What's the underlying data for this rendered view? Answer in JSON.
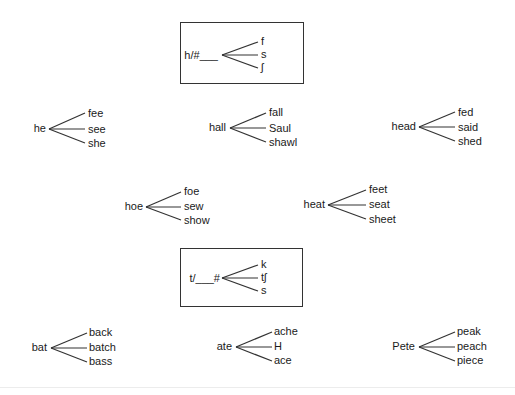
{
  "rules": [
    {
      "id": "rule-h-initial",
      "context": "h/#___",
      "branches": [
        "f",
        "s",
        "ʃ"
      ],
      "box": {
        "x": 180,
        "y": 22,
        "w": 124,
        "h": 62
      },
      "root_right": 218,
      "root_y": 49,
      "apex": {
        "x": 222,
        "y": 55
      },
      "ends_x": 258,
      "ends_y": [
        42,
        55,
        68
      ],
      "branch_x": 261
    },
    {
      "id": "rule-t-final",
      "context": "t/___#",
      "branches": [
        "k",
        "tʃ",
        "s"
      ],
      "box": {
        "x": 180,
        "y": 248,
        "w": 123,
        "h": 59
      },
      "root_right": 220,
      "root_y": 272,
      "apex": {
        "x": 222,
        "y": 278
      },
      "ends_x": 258,
      "ends_y": [
        265,
        278,
        291
      ],
      "branch_x": 261
    }
  ],
  "groups": [
    {
      "id": "he",
      "root": "he",
      "words": [
        "fee",
        "see",
        "she"
      ],
      "root_right": 46,
      "apex": {
        "x": 49,
        "y": 129
      },
      "ends_x": 85,
      "ends_y": [
        113,
        129,
        143
      ],
      "word_x": 88,
      "word_y": [
        107,
        123,
        137
      ]
    },
    {
      "id": "hall",
      "root": "hall",
      "words": [
        "fall",
        "Saul",
        "shawl"
      ],
      "root_right": 226,
      "apex": {
        "x": 230,
        "y": 128
      },
      "ends_x": 266,
      "ends_y": [
        113,
        128,
        142
      ],
      "word_x": 269,
      "word_y": [
        106,
        122,
        136
      ]
    },
    {
      "id": "head",
      "root": "head",
      "words": [
        "fed",
        "said",
        "shed"
      ],
      "root_right": 416,
      "apex": {
        "x": 419,
        "y": 127
      },
      "ends_x": 455,
      "ends_y": [
        112,
        127,
        141
      ],
      "word_x": 458,
      "word_y": [
        106,
        121,
        135
      ]
    },
    {
      "id": "hoe",
      "root": "hoe",
      "words": [
        "foe",
        "sew",
        "show"
      ],
      "root_right": 143,
      "apex": {
        "x": 146,
        "y": 207
      },
      "ends_x": 181,
      "ends_y": [
        192,
        207,
        220
      ],
      "word_x": 184,
      "word_y": [
        185,
        200,
        214
      ]
    },
    {
      "id": "heat",
      "root": "heat",
      "words": [
        "feet",
        "seat",
        "sheet"
      ],
      "root_right": 325,
      "apex": {
        "x": 328,
        "y": 205
      },
      "ends_x": 366,
      "ends_y": [
        190,
        205,
        219
      ],
      "word_x": 369,
      "word_y": [
        183,
        198,
        213
      ]
    },
    {
      "id": "bat",
      "root": "bat",
      "words": [
        "back",
        "batch",
        "bass"
      ],
      "root_right": 47,
      "apex": {
        "x": 51,
        "y": 348
      },
      "ends_x": 87,
      "ends_y": [
        333,
        348,
        362
      ],
      "word_x": 89,
      "word_y": [
        326,
        341,
        355
      ]
    },
    {
      "id": "ate",
      "root": "ate",
      "words": [
        "ache",
        "H",
        "ace"
      ],
      "root_right": 232,
      "apex": {
        "x": 236,
        "y": 347
      },
      "ends_x": 272,
      "ends_y": [
        332,
        347,
        361
      ],
      "word_x": 274,
      "word_y": [
        325,
        340,
        354
      ]
    },
    {
      "id": "pete",
      "root": "Pete",
      "words": [
        "peak",
        "peach",
        "piece"
      ],
      "root_right": 415,
      "apex": {
        "x": 419,
        "y": 347
      },
      "ends_x": 455,
      "ends_y": [
        332,
        347,
        361
      ],
      "word_x": 457,
      "word_y": [
        325,
        340,
        354
      ]
    }
  ],
  "colors": {
    "ink": "#1a1a1a",
    "line": "#333333",
    "background": "#ffffff"
  }
}
